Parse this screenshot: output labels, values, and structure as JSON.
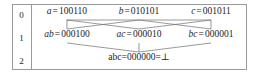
{
  "figure": {
    "kind": "lattice-diagram",
    "levels_label_column_header": "",
    "levels": [
      {
        "index": "0",
        "nodes": [
          {
            "label": "a",
            "eq": "=",
            "bits": "100110"
          },
          {
            "label": "b",
            "eq": "=",
            "bits": "010101"
          },
          {
            "label": "c",
            "eq": "=",
            "bits": "001011"
          }
        ]
      },
      {
        "index": "1",
        "nodes": [
          {
            "label": "ab",
            "eq": "=",
            "bits": "000100"
          },
          {
            "label": "ac",
            "eq": "=",
            "bits": "000010"
          },
          {
            "label": "bc",
            "eq": "=",
            "bits": "000001"
          }
        ]
      },
      {
        "index": "2",
        "nodes": [
          {
            "label": "abc",
            "eq": "=",
            "bits": "000000",
            "eq2": "=",
            "bottom": "⊥"
          }
        ]
      }
    ]
  },
  "colors": {
    "border": "#9a9a9a",
    "edge": "#6e6e6e",
    "text": "#1c1c1c",
    "background": "#ffffff"
  }
}
